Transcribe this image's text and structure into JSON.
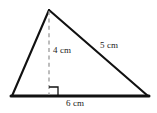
{
  "figure": {
    "kind": "geometry-diagram",
    "shape": "triangle",
    "background_color": "#ffffff",
    "stroke_color": "#111111",
    "dashed_color": "#9a9a9a",
    "text_color": "#1a1a1a",
    "labels": {
      "height": "4 cm",
      "hypotenuse": "5 cm",
      "base": "6 cm"
    },
    "measurements": [
      {
        "name": "height",
        "value": 4,
        "unit": "cm",
        "element": "altitude"
      },
      {
        "name": "hypotenuse",
        "value": 5,
        "unit": "cm",
        "element": "right-side"
      },
      {
        "name": "base",
        "value": 6,
        "unit": "cm",
        "element": "bottom-side"
      }
    ],
    "vertices": {
      "apex": {
        "x": 49,
        "y": 10
      },
      "bottom_left": {
        "x": 12,
        "y": 96
      },
      "bottom_right": {
        "x": 148,
        "y": 96
      },
      "altitude_foot": {
        "x": 49,
        "y": 96
      }
    },
    "right_angle_marker": {
      "x": 49,
      "y": 87,
      "size": 9
    }
  }
}
